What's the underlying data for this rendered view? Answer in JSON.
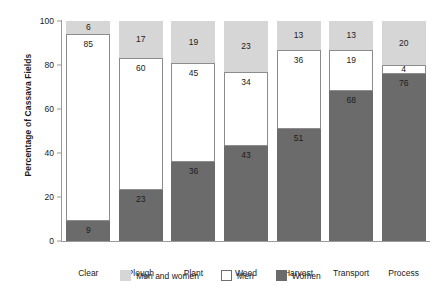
{
  "chart_data": {
    "type": "bar",
    "subtype": "stacked-bar-100",
    "title": "",
    "xlabel": "",
    "ylabel": "Percentage of Cassava Fields",
    "ylim": [
      0,
      100
    ],
    "yticks": [
      0,
      20,
      40,
      60,
      80,
      100
    ],
    "ytick_labels": [
      "0",
      "20",
      "40",
      "60",
      "80",
      "100"
    ],
    "grid": false,
    "legend_position": "bottom-center",
    "categories": [
      "Clear",
      "Plough",
      "Plant",
      "Weed",
      "Harvest",
      "Transport",
      "Process"
    ],
    "series": [
      {
        "name": "Women",
        "color": "#6b6b6b",
        "values": [
          9,
          23,
          36,
          43,
          51,
          68,
          76
        ]
      },
      {
        "name": "Men",
        "color": "#ffffff",
        "values": [
          85,
          60,
          45,
          34,
          36,
          19,
          4
        ]
      },
      {
        "name": "Men and women",
        "color": "#d6d6d6",
        "values": [
          6,
          17,
          19,
          23,
          13,
          13,
          20
        ]
      }
    ],
    "stack_order_bottom_to_top": [
      "Women",
      "Men",
      "Men and women"
    ],
    "data_labels_shown": true
  },
  "legend": {
    "items": [
      {
        "label": "Men and women",
        "color": "#d6d6d6"
      },
      {
        "label": "Men",
        "color": "#ffffff"
      },
      {
        "label": "Women",
        "color": "#6b6b6b"
      }
    ]
  },
  "colors": {
    "both": "#d6d6d6",
    "men": "#ffffff",
    "women": "#6b6b6b",
    "axis": "#9a9a9a",
    "text": "#1a1a1a",
    "background": "#ffffff"
  }
}
